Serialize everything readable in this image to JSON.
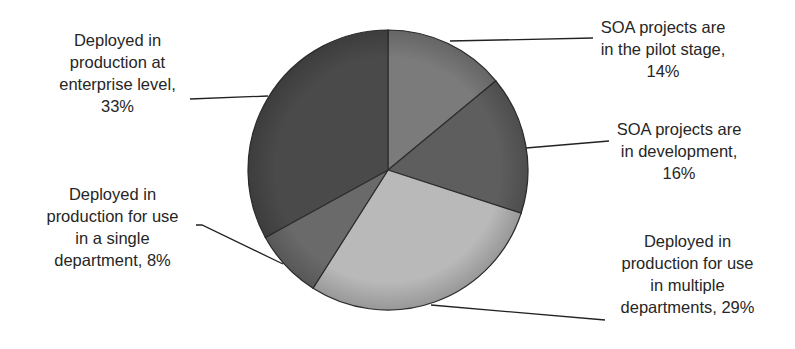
{
  "chart_data": {
    "type": "pie",
    "title": "",
    "start_angle_deg": 0,
    "direction": "clockwise",
    "slices": [
      {
        "label": "SOA projects are in the pilot stage",
        "value": 14,
        "display": "14%",
        "color": "#7b7b7b"
      },
      {
        "label": "SOA projects are in development",
        "value": 16,
        "display": "16%",
        "color": "#5e5e5e"
      },
      {
        "label": "Deployed in production for use in multiple departments",
        "value": 29,
        "display": "29%",
        "color": "#b9b9b9"
      },
      {
        "label": "Deployed in production for use in a single department",
        "value": 8,
        "display": "8%",
        "color": "#6a6a6a"
      },
      {
        "label": "Deployed in production at enterprise level",
        "value": 33,
        "display": "33%",
        "color": "#4a4a4a"
      }
    ],
    "legend": "none",
    "data_labels": "outside with leader lines"
  },
  "labels": {
    "pilot": [
      "SOA projects are",
      "in the pilot stage,",
      "14%"
    ],
    "development": [
      "SOA projects are",
      "in development,",
      "16%"
    ],
    "multiple": [
      "Deployed in",
      "production for use",
      "in multiple",
      "departments, 29%"
    ],
    "single": [
      "Deployed in",
      "production for use",
      "in a single",
      "department, 8%"
    ],
    "enterprise": [
      "Deployed in",
      "production at",
      "enterprise level,",
      "33%"
    ]
  }
}
